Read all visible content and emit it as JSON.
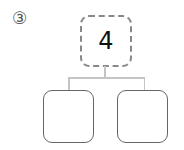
{
  "problem_label": "③",
  "tree": {
    "root": {
      "value": "4"
    },
    "children": [
      {
        "value": ""
      },
      {
        "value": ""
      }
    ]
  },
  "colors": {
    "root_border": "#888888",
    "child_border": "#666666",
    "connector": "#c4c4c4"
  }
}
